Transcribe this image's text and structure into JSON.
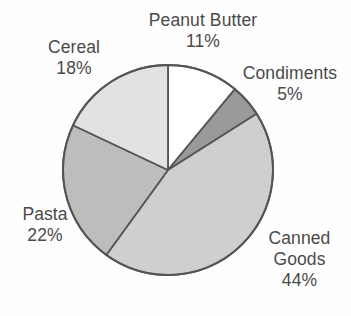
{
  "chart_data": {
    "type": "pie",
    "title": "",
    "subtitle": "",
    "xlabel": "",
    "ylabel": "",
    "legend_position": "none",
    "grid": false,
    "units": "percent",
    "start_angle_deg": 0,
    "direction": "clockwise",
    "categories": [
      "Peanut Butter",
      "Condiments",
      "Canned Goods",
      "Pasta",
      "Cereal"
    ],
    "values": [
      11,
      5,
      44,
      22,
      18
    ],
    "slices": [
      {
        "label": "Peanut Butter",
        "value": 11,
        "value_text": "11%",
        "color": "#ffffff",
        "start_deg": 0,
        "end_deg": 39.6
      },
      {
        "label": "Condiments",
        "value": 5,
        "value_text": "5%",
        "color": "#9a9a9a",
        "start_deg": 39.6,
        "end_deg": 57.6
      },
      {
        "label": "Canned Goods",
        "value": 44,
        "value_text": "44%",
        "color": "#cfcfcf",
        "start_deg": 57.6,
        "end_deg": 216.0
      },
      {
        "label": "Pasta",
        "value": 22,
        "value_text": "22%",
        "color": "#bdbdbd",
        "start_deg": 216.0,
        "end_deg": 295.2
      },
      {
        "label": "Cereal",
        "value": 18,
        "value_text": "18%",
        "color": "#e2e2e2",
        "start_deg": 295.2,
        "end_deg": 360.0
      }
    ]
  },
  "labels": {
    "peanut_butter": {
      "name": "Peanut Butter",
      "value": "11%"
    },
    "condiments": {
      "name": "Condiments",
      "value": "5%"
    },
    "canned_goods": {
      "name_line1": "Canned",
      "name_line2": "Goods",
      "value": "44%"
    },
    "pasta": {
      "name": "Pasta",
      "value": "22%"
    },
    "cereal": {
      "name": "Cereal",
      "value": "18%"
    }
  },
  "style": {
    "background": "#fefefe",
    "text_color": "#4a4a4a",
    "outline_color": "#555555"
  },
  "geometry": {
    "center_x": 168,
    "center_y": 170,
    "radius": 105
  }
}
